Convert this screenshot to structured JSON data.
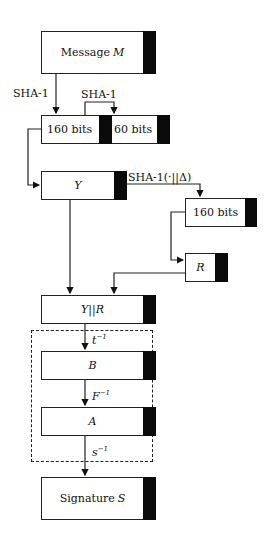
{
  "diagram": {
    "boxes": {
      "message": {
        "text": "Message ",
        "var": "M"
      },
      "bits_left": {
        "text": "160 bits"
      },
      "bits_right": {
        "text": "60 bits"
      },
      "y": {
        "var": "Y"
      },
      "bits_r160": {
        "text": "160 bits"
      },
      "r": {
        "var": "R"
      },
      "yr": {
        "var": "Y||R"
      },
      "b": {
        "var": "B"
      },
      "a": {
        "var": "A"
      },
      "signature": {
        "text": "Signature ",
        "var": "S"
      }
    },
    "edges": {
      "sha1_left": "SHA-1",
      "sha1_top": "SHA-1",
      "sha1_delta": "SHA-1(·||Δ)",
      "t_inv": {
        "base": "t",
        "sup": "−1"
      },
      "f_inv": {
        "base": "F",
        "sup": "−1"
      },
      "s_inv": {
        "base": "s",
        "sup": "−1"
      }
    }
  }
}
